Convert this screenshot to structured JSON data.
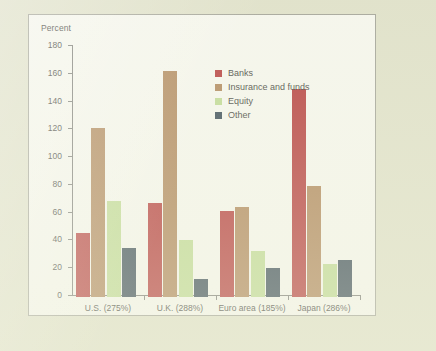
{
  "figure": {
    "background_color": "#e2e3cd",
    "panel_color": "#fdfdf9",
    "border_color": "#9a9a93"
  },
  "chart_data": {
    "type": "bar",
    "title": "Percent",
    "xlabel": "",
    "ylabel": "Percent",
    "ylim": [
      0,
      180
    ],
    "yticks": [
      0,
      20,
      40,
      60,
      80,
      100,
      120,
      140,
      160,
      180
    ],
    "grid": false,
    "legend_position": "upper center",
    "categories": [
      "U.S. (275%)",
      "U.K. (288%)",
      "Euro area (185%)",
      "Japan (286%)"
    ],
    "series": [
      {
        "name": "Banks",
        "color": "#b02026",
        "values": [
          46,
          68,
          62,
          150
        ]
      },
      {
        "name": "Insurance and funds",
        "color": "#a9784a",
        "values": [
          122,
          163,
          65,
          80
        ]
      },
      {
        "name": "Equity",
        "color": "#bcdb8e",
        "values": [
          69,
          41,
          33,
          24
        ]
      },
      {
        "name": "Other",
        "color": "#1f3347",
        "values": [
          35,
          13,
          21,
          27
        ]
      }
    ]
  }
}
